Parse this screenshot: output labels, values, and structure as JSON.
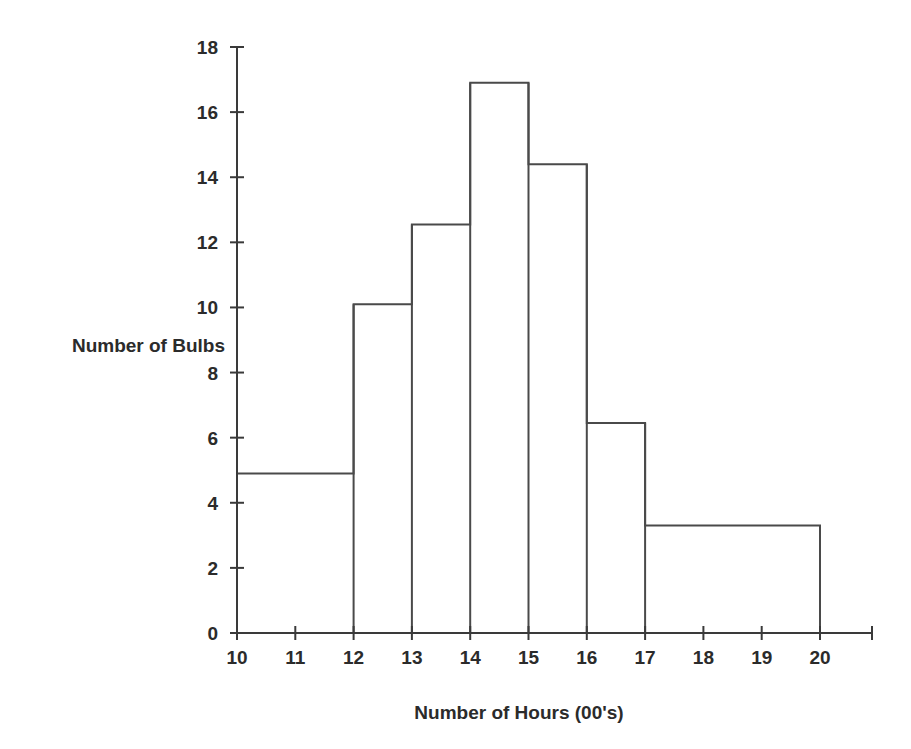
{
  "chart_data": {
    "type": "bar",
    "title": "",
    "subtitle": "",
    "xlabel": "Number of Hours (00's)",
    "ylabel": "Number of Bulbs",
    "xlim": [
      10,
      20.9
    ],
    "ylim": [
      0,
      18
    ],
    "grid": false,
    "legend": null,
    "x_tick_labels": [
      "10",
      "11",
      "12",
      "13",
      "14",
      "15",
      "16",
      "17",
      "18",
      "19",
      "20"
    ],
    "x_tick_values": [
      10,
      11,
      12,
      13,
      14,
      15,
      16,
      17,
      18,
      19,
      20
    ],
    "y_tick_labels": [
      "0",
      "2",
      "4",
      "6",
      "8",
      "10",
      "12",
      "14",
      "16",
      "18"
    ],
    "y_tick_values": [
      0,
      2,
      4,
      6,
      8,
      10,
      12,
      14,
      16,
      18
    ],
    "bins": [
      {
        "label": "10-12",
        "x0": 10,
        "x1": 12,
        "value": 4.9
      },
      {
        "label": "12-13",
        "x0": 12,
        "x1": 13,
        "value": 10.1
      },
      {
        "label": "13-14",
        "x0": 13,
        "x1": 14,
        "value": 12.55
      },
      {
        "label": "14-15",
        "x0": 14,
        "x1": 15,
        "value": 16.9
      },
      {
        "label": "15-16",
        "x0": 15,
        "x1": 16,
        "value": 14.4
      },
      {
        "label": "16-17",
        "x0": 16,
        "x1": 17,
        "value": 6.45
      },
      {
        "label": "17-20",
        "x0": 17,
        "x1": 20,
        "value": 3.3
      }
    ],
    "bar_fill": "#ffffff",
    "bar_stroke": "#4a4a4a",
    "axis_color": "#3a3a3a",
    "background": "#ffffff"
  }
}
